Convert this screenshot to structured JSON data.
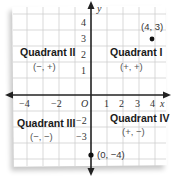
{
  "diagram": {
    "axes": {
      "x_label": "x",
      "y_label": "y",
      "origin_label": "O",
      "x_ticks": [
        "−4",
        "−2",
        "1",
        "2",
        "3",
        "4"
      ],
      "y_ticks": [
        "4",
        "3",
        "2",
        "1",
        "−2",
        "−3"
      ]
    },
    "quadrants": [
      {
        "name": "Quadrant I",
        "signs": "(+, +)"
      },
      {
        "name": "Quadrant II",
        "signs": "(−, +)"
      },
      {
        "name": "Quadrant III",
        "signs": "(−, −)"
      },
      {
        "name": "Quadrant IV",
        "signs": "(+, −)"
      }
    ],
    "points": [
      {
        "label": "(4, 3)",
        "x": 4,
        "y": 3
      },
      {
        "label": "(0, −4)",
        "x": 0,
        "y": -4
      }
    ],
    "colors": {
      "grid": "#c8c8c8",
      "axis": "#222222",
      "point": "#111111",
      "background": "#ffffff"
    }
  }
}
